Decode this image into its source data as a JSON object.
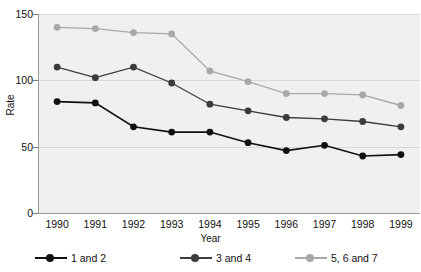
{
  "chart_data": {
    "type": "line",
    "title": "",
    "xlabel": "Year",
    "ylabel": "Rate",
    "categories": [
      "1990",
      "1991",
      "1992",
      "1993",
      "1994",
      "1995",
      "1996",
      "1997",
      "1998",
      "1999"
    ],
    "x": [
      1990,
      1991,
      1992,
      1993,
      1994,
      1995,
      1996,
      1997,
      1998,
      1999
    ],
    "ylim": [
      0,
      150
    ],
    "yticks": [
      0,
      50,
      100,
      150
    ],
    "ytick_labels": [
      "0",
      "50",
      "100",
      "150"
    ],
    "grid": true,
    "legend_position": "bottom",
    "series": [
      {
        "name": "1 and 2",
        "color": "#101010",
        "values": [
          84,
          83,
          65,
          61,
          61,
          53,
          47,
          51,
          43,
          44
        ]
      },
      {
        "name": "3 and 4",
        "color": "#3b3b3b",
        "values": [
          110,
          102,
          110,
          98,
          82,
          77,
          72,
          71,
          69,
          65
        ]
      },
      {
        "name": "5, 6 and 7",
        "color": "#a8a8a8",
        "values": [
          140,
          139,
          136,
          135,
          107,
          99,
          90,
          90,
          89,
          81
        ]
      }
    ]
  },
  "axes": {
    "y_title": "Rate",
    "x_title": "Year"
  },
  "legend": {
    "items": [
      {
        "label": "1 and 2",
        "color": "#101010"
      },
      {
        "label": "3 and 4",
        "color": "#3b3b3b"
      },
      {
        "label": "5, 6 and 7",
        "color": "#a8a8a8"
      }
    ]
  },
  "style": {
    "plot_background": "#f0f0f0",
    "grid_color": "#d8d8d8",
    "axis_color": "#9a9a9a",
    "text_color": "#111111"
  }
}
